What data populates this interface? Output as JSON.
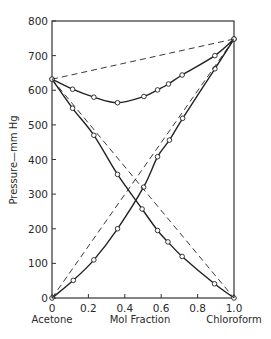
{
  "chart_data": {
    "type": "line",
    "title": "",
    "xlabel": "Mol Fraction",
    "ylabel": "Pressure—mm Hg",
    "x_left_label": "Acetone",
    "x_right_label": "Chloroform",
    "xlim": [
      0,
      1.0
    ],
    "ylim": [
      0,
      800
    ],
    "xticks": [
      "0",
      "0.2",
      "0.4",
      "0.6",
      "0.8",
      "1.0"
    ],
    "yticks": [
      "0",
      "100",
      "200",
      "300",
      "400",
      "500",
      "600",
      "700",
      "800"
    ],
    "grid": false,
    "legend": "none",
    "series": [
      {
        "name": "Total vapor pressure (observed)",
        "style": "solid-with-markers",
        "x": [
          0,
          0.113,
          0.23,
          0.36,
          0.505,
          0.58,
          0.64,
          0.715,
          0.895,
          1.0
        ],
        "y": [
          632,
          603,
          580,
          564,
          582,
          601,
          618,
          644,
          700,
          748
        ]
      },
      {
        "name": "Acetone partial pressure (observed)",
        "style": "solid-with-markers",
        "x": [
          0,
          0.113,
          0.23,
          0.36,
          0.495,
          0.58,
          0.637,
          0.715,
          0.893,
          1.0
        ],
        "y": [
          632,
          548,
          470,
          357,
          257,
          195,
          162,
          120,
          41,
          0
        ]
      },
      {
        "name": "Chloroform partial pressure (observed)",
        "style": "solid-with-markers",
        "x": [
          0,
          0.117,
          0.23,
          0.36,
          0.503,
          0.58,
          0.645,
          0.718,
          0.895,
          1.0
        ],
        "y": [
          0,
          51,
          110,
          200,
          320,
          408,
          456,
          519,
          662,
          748
        ]
      },
      {
        "name": "Total pressure (ideal, Raoult)",
        "style": "dashed",
        "x": [
          0,
          1.0
        ],
        "y": [
          632,
          748
        ]
      },
      {
        "name": "Acetone partial (ideal, Raoult)",
        "style": "dashed",
        "x": [
          0,
          1.0
        ],
        "y": [
          632,
          0
        ]
      },
      {
        "name": "Chloroform partial (ideal, Raoult)",
        "style": "dashed",
        "x": [
          0,
          1.0
        ],
        "y": [
          0,
          748
        ]
      }
    ]
  }
}
